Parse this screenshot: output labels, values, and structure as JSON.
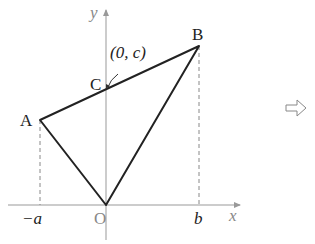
{
  "diagram": {
    "axes": {
      "x_label": "x",
      "y_label": "y",
      "origin_label": "O"
    },
    "points": {
      "A": {
        "label": "A"
      },
      "B": {
        "label": "B"
      },
      "C": {
        "label": "C",
        "annotation": "(0, c)"
      }
    },
    "ticks": {
      "neg_a": "−a",
      "b": "b"
    },
    "colors": {
      "axis": "#999999",
      "line": "#222222",
      "dashed": "#888888"
    },
    "next_symbol": "⇨"
  }
}
